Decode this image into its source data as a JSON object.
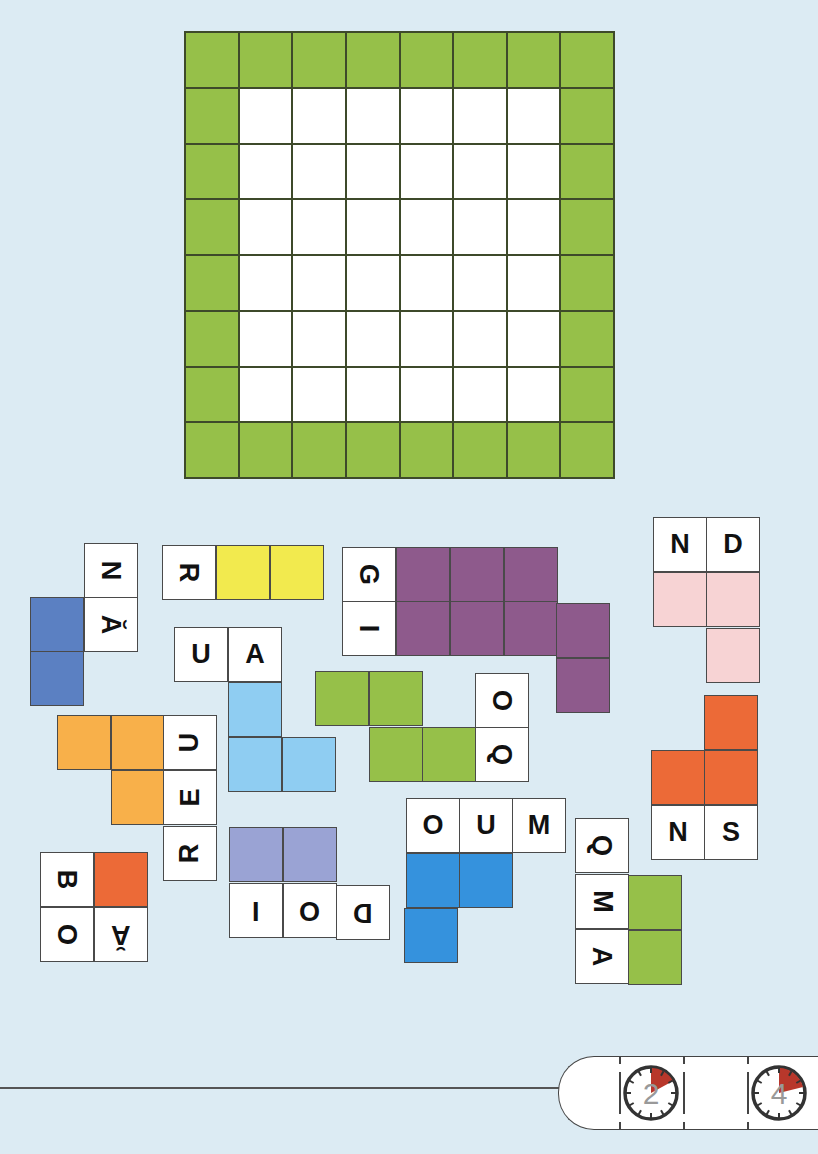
{
  "colors": {
    "background": "#dcebf3",
    "board_border_green": "#96c049",
    "board_inner": "#ffffff",
    "blue_dark": "#5b80c2",
    "yellow": "#f2ea4e",
    "light_blue": "#8fcdf2",
    "purple": "#8e5a8c",
    "pink": "#f7d3d4",
    "orange_red": "#ec6a37",
    "green": "#96c049",
    "amber": "#f8b04a",
    "lavender": "#9aa3d4",
    "blue_medium": "#3592dd",
    "clock_fill": "#b8372b"
  },
  "board": {
    "rows": 8,
    "cols": 8,
    "border_ring": "green",
    "inner_size": "6x6 white"
  },
  "pieces": [
    {
      "id": "p1",
      "color": "blue_dark",
      "letters": [
        "N",
        "Ă"
      ]
    },
    {
      "id": "p2",
      "color": "yellow",
      "letters": [
        "R"
      ]
    },
    {
      "id": "p3",
      "color": "light_blue",
      "letters": [
        "U",
        "A"
      ]
    },
    {
      "id": "p4",
      "color": "purple",
      "letters": [
        "G",
        "I"
      ]
    },
    {
      "id": "p5",
      "color": "pink",
      "letters": [
        "N",
        "D"
      ]
    },
    {
      "id": "p6",
      "color": "orange_red",
      "letters": [
        "N",
        "S"
      ]
    },
    {
      "id": "p7",
      "color": "green",
      "letters": [
        "O",
        "Q"
      ]
    },
    {
      "id": "p8",
      "color": "amber",
      "letters": [
        "U",
        "E",
        "R"
      ]
    },
    {
      "id": "p9",
      "color": "orange_red",
      "letters": [
        "B",
        "O",
        "Ă"
      ]
    },
    {
      "id": "p10",
      "color": "lavender",
      "letters": [
        "I",
        "O",
        "D"
      ]
    },
    {
      "id": "p11",
      "color": "blue_medium",
      "letters": [
        "O",
        "U",
        "M"
      ]
    },
    {
      "id": "p12",
      "color": "green",
      "letters": [
        "Q",
        "M",
        "A"
      ]
    }
  ],
  "timer": {
    "clocks": [
      {
        "label": "2",
        "icon": "stopwatch-icon"
      },
      {
        "label": "4",
        "icon": "stopwatch-icon"
      }
    ]
  }
}
